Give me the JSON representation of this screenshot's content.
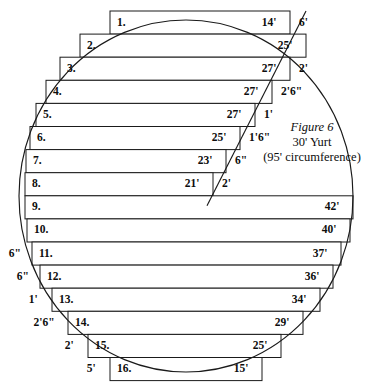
{
  "figure": {
    "caption": {
      "title": "Figure 6",
      "line2": "30' Yurt",
      "line3": "(95' circumference)"
    },
    "geometry": {
      "ellipse_cx": 186,
      "ellipse_cy": 196,
      "ellipse_rx": 167,
      "ellipse_ry": 176,
      "row_top": 11,
      "row_height": 23.1,
      "row_count": 16
    },
    "rows": [
      {
        "number": "1.",
        "inner": "14'",
        "outer_right": "6'",
        "outer_left": "",
        "x0": 110,
        "x1": 290,
        "y": 11.0,
        "h": 23.1
      },
      {
        "number": "2.",
        "inner": "25'",
        "outer_right": "",
        "outer_left": "",
        "x0": 80,
        "x1": 306,
        "y": 34.1,
        "h": 23.1
      },
      {
        "number": "3.",
        "inner": "27'",
        "outer_right": "2'",
        "outer_left": "",
        "x0": 60,
        "x1": 290,
        "y": 57.2,
        "h": 23.1
      },
      {
        "number": "4.",
        "inner": "27'",
        "outer_right": "2'6\"",
        "outer_left": "",
        "x0": 46,
        "x1": 272,
        "y": 80.3,
        "h": 23.1
      },
      {
        "number": "5.",
        "inner": "27'",
        "outer_right": "1'",
        "outer_left": "",
        "x0": 36,
        "x1": 255,
        "y": 103.4,
        "h": 23.1
      },
      {
        "number": "6.",
        "inner": "25'",
        "outer_right": "1'6\"",
        "outer_left": "",
        "x0": 30,
        "x1": 240,
        "y": 126.5,
        "h": 23.1
      },
      {
        "number": "7.",
        "inner": "23'",
        "outer_right": "6\"",
        "outer_left": "",
        "x0": 26,
        "x1": 226,
        "y": 149.6,
        "h": 23.1
      },
      {
        "number": "8.",
        "inner": "21'",
        "outer_right": "2'",
        "outer_left": "",
        "x0": 25,
        "x1": 213,
        "y": 172.7,
        "h": 23.1
      },
      {
        "number": "9.",
        "inner": "42'",
        "outer_right": "",
        "outer_left": "",
        "x0": 25,
        "x1": 353,
        "y": 195.8,
        "h": 23.1
      },
      {
        "number": "10.",
        "inner": "40'",
        "outer_right": "",
        "outer_left": "",
        "x0": 27,
        "x1": 350,
        "y": 218.9,
        "h": 23.1
      },
      {
        "number": "11.",
        "inner": "37'",
        "outer_right": "",
        "outer_left": "6\"",
        "x0": 32,
        "x1": 341,
        "y": 242.0,
        "h": 23.1
      },
      {
        "number": "12.",
        "inner": "36'",
        "outer_right": "",
        "outer_left": "6\"",
        "x0": 40,
        "x1": 333,
        "y": 265.1,
        "h": 23.1
      },
      {
        "number": "13.",
        "inner": "34'",
        "outer_right": "",
        "outer_left": "1'",
        "x0": 52,
        "x1": 320,
        "y": 288.2,
        "h": 23.1
      },
      {
        "number": "14.",
        "inner": "29'",
        "outer_right": "",
        "outer_left": "2'6\"",
        "x0": 68,
        "x1": 303,
        "y": 311.3,
        "h": 23.1
      },
      {
        "number": "15.",
        "inner": "25'",
        "outer_right": "",
        "outer_left": "2'",
        "x0": 88,
        "x1": 281,
        "y": 334.4,
        "h": 23.1
      },
      {
        "number": "16.",
        "inner": "15'",
        "outer_right": "",
        "outer_left": "5'",
        "x0": 110,
        "x1": 262,
        "y": 357.5,
        "h": 23.1
      }
    ],
    "colors": {
      "ink": "#1a1a1a",
      "paper": "#ffffff"
    }
  }
}
